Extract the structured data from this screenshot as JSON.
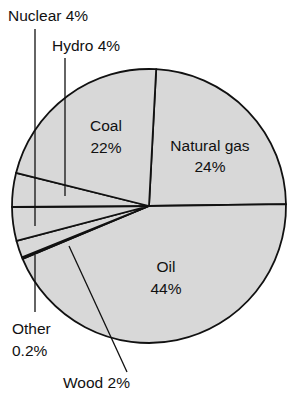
{
  "chart_data": {
    "type": "pie",
    "title": "",
    "subtitle": "",
    "xlabel": "",
    "ylabel": "",
    "legend_position": "none",
    "grid": false,
    "units": "percent",
    "total": 100,
    "categories": [
      "Natural gas",
      "Oil",
      "Other",
      "Wood",
      "Hydro",
      "Nuclear",
      "Coal"
    ],
    "values": [
      24,
      44,
      0.2,
      2,
      4,
      4,
      22
    ],
    "slices": [
      {
        "name": "natural-gas",
        "label": "Natural gas",
        "value_label": "24%",
        "value": 24,
        "label_placement": "inside",
        "label_x": 210,
        "label_y": 147,
        "value_x": 210,
        "value_y": 168
      },
      {
        "name": "oil",
        "label": "Oil",
        "value_label": "44%",
        "value": 44,
        "label_placement": "inside",
        "label_x": 166,
        "label_y": 268,
        "value_x": 166,
        "value_y": 290
      },
      {
        "name": "other",
        "label": "Other",
        "value_label": "0.2%",
        "value": 0.2,
        "label_placement": "outside",
        "label_x": 12,
        "label_y": 330,
        "value_x": 12,
        "value_y": 352
      },
      {
        "name": "wood",
        "label": "Wood 2%",
        "value_label": "2%",
        "value": 2,
        "label_placement": "outside",
        "label_x": 63,
        "label_y": 384
      },
      {
        "name": "hydro",
        "label": "Hydro 4%",
        "value_label": "4%",
        "value": 4,
        "label_placement": "outside",
        "label_x": 52,
        "label_y": 47
      },
      {
        "name": "nuclear",
        "label": "Nuclear 4%",
        "value_label": "4%",
        "value": 4,
        "label_placement": "outside",
        "label_x": 8,
        "label_y": 17
      },
      {
        "name": "coal",
        "label": "Coal",
        "value_label": "22%",
        "value": 22,
        "label_placement": "inside",
        "label_x": 106,
        "label_y": 127,
        "value_x": 106,
        "value_y": 149
      }
    ],
    "colors": {
      "slice_fill": "#d8d8d8",
      "outline": "#111111",
      "background": "#ffffff",
      "text": "#111111",
      "leader_line": "#111111"
    },
    "geometry": {
      "center_x": 149,
      "center_y": 206,
      "radius": 137,
      "start_angle_deg": -87
    }
  }
}
